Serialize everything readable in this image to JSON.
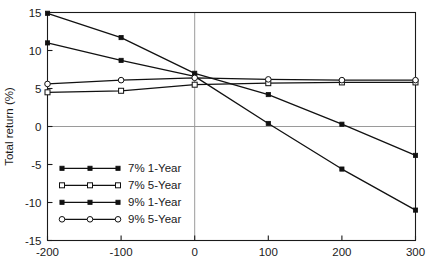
{
  "chart_data": {
    "type": "line",
    "title": "",
    "xlabel": "",
    "ylabel": "Total return (%)",
    "xlim": [
      -200,
      300
    ],
    "ylim": [
      -15,
      15
    ],
    "xticks": [
      -200,
      -100,
      0,
      100,
      200,
      300
    ],
    "yticks": [
      -15,
      -10,
      -5,
      0,
      5,
      10,
      15
    ],
    "xtick_labels": [
      "-200",
      "-100",
      "0",
      "100",
      "200",
      "300"
    ],
    "ytick_labels": [
      "-15",
      "-10",
      "-5",
      "0",
      "5",
      "10",
      "15"
    ],
    "grid": false,
    "reference_lines": {
      "horizontal_zero": 0,
      "vertical_zero": 0
    },
    "legend_position": "lower-left-inside",
    "x": [
      -200,
      -100,
      0,
      100,
      200,
      300
    ],
    "series": [
      {
        "name": "7% 1-Year",
        "marker": "filled-square",
        "values": [
          11.0,
          8.7,
          6.6,
          0.4,
          -5.6,
          -11.0
        ]
      },
      {
        "name": "7% 5-Year",
        "marker": "open-square",
        "values": [
          4.5,
          4.7,
          5.5,
          5.7,
          5.8,
          5.8
        ]
      },
      {
        "name": "9% 1-Year",
        "marker": "filled-square",
        "values": [
          14.9,
          11.7,
          7.0,
          4.2,
          0.3,
          -3.8
        ]
      },
      {
        "name": "9% 5-Year",
        "marker": "open-circle",
        "values": [
          5.6,
          6.1,
          6.4,
          6.2,
          6.1,
          6.1
        ]
      }
    ]
  },
  "colors": {
    "line": "#111111",
    "axis": "#1a1a1a",
    "reference": "#9a9a9a",
    "background": "#ffffff",
    "marker_fill_open": "#ffffff"
  },
  "legend": {
    "items": [
      {
        "label": "7% 1-Year",
        "marker": "filled-square"
      },
      {
        "label": "7% 5-Year",
        "marker": "open-square"
      },
      {
        "label": "9% 1-Year",
        "marker": "filled-square"
      },
      {
        "label": "9% 5-Year",
        "marker": "open-circle"
      }
    ]
  }
}
